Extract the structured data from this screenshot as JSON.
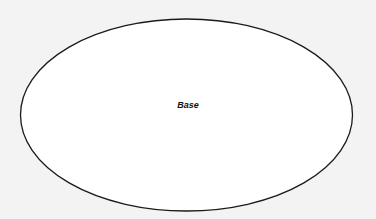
{
  "diagram": {
    "shape": "ellipse",
    "label": "Base",
    "fill": "#ffffff",
    "stroke": "#1a1a1a",
    "background": "#f3f3f3"
  }
}
